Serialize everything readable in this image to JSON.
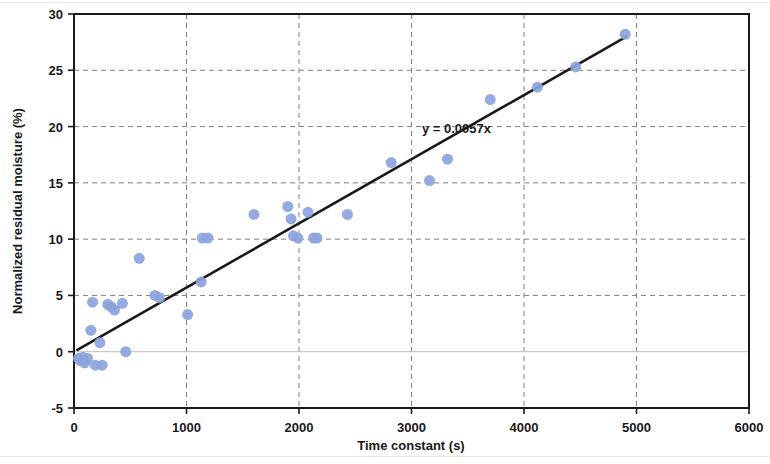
{
  "chart_data": {
    "type": "scatter",
    "title": "",
    "xlabel": "Time constant (s)",
    "ylabel": "Normalized residual moisture (%)",
    "xlim": [
      0,
      6000
    ],
    "ylim": [
      -5,
      30
    ],
    "xticks": [
      0,
      1000,
      2000,
      3000,
      4000,
      5000,
      6000
    ],
    "yticks": [
      -5,
      0,
      5,
      10,
      15,
      20,
      25,
      30
    ],
    "xtick_labels": [
      "0",
      "1000",
      "2000",
      "3000",
      "4000",
      "5000",
      "6000"
    ],
    "ytick_labels": [
      "-5",
      "0",
      "5",
      "10",
      "15",
      "20",
      "25",
      "30"
    ],
    "grid": true,
    "grid_style": "dashed",
    "grid_color": "#808080",
    "legend": false,
    "marker_color": "#8ba3dd",
    "marker_shape": "circle",
    "marker_size": 11,
    "series": [
      {
        "name": "Measurements",
        "points": [
          [
            40,
            -0.6
          ],
          [
            55,
            -0.8
          ],
          [
            80,
            -0.5
          ],
          [
            95,
            -1.0
          ],
          [
            120,
            -0.6
          ],
          [
            150,
            1.9
          ],
          [
            165,
            4.4
          ],
          [
            190,
            -1.2
          ],
          [
            230,
            0.8
          ],
          [
            250,
            -1.2
          ],
          [
            300,
            4.2
          ],
          [
            330,
            4.0
          ],
          [
            360,
            3.7
          ],
          [
            430,
            4.3
          ],
          [
            460,
            0.0
          ],
          [
            580,
            8.3
          ],
          [
            720,
            5.0
          ],
          [
            760,
            4.8
          ],
          [
            1010,
            3.3
          ],
          [
            1130,
            6.2
          ],
          [
            1140,
            10.1
          ],
          [
            1190,
            10.1
          ],
          [
            1600,
            12.2
          ],
          [
            1900,
            12.9
          ],
          [
            1930,
            11.8
          ],
          [
            1950,
            10.3
          ],
          [
            1990,
            10.1
          ],
          [
            2080,
            12.4
          ],
          [
            2130,
            10.1
          ],
          [
            2160,
            10.1
          ],
          [
            2430,
            12.2
          ],
          [
            2820,
            16.8
          ],
          [
            3160,
            15.2
          ],
          [
            3320,
            17.1
          ],
          [
            3700,
            22.4
          ],
          [
            4120,
            23.5
          ],
          [
            4460,
            25.3
          ],
          [
            4900,
            28.2
          ]
        ]
      }
    ],
    "trendline": {
      "equation_label": "y = 0.0057x",
      "slope": 0.0057,
      "intercept": 0,
      "x_start": 30,
      "x_end": 4910,
      "color": "#1a1a1a",
      "width": 2.6
    },
    "annotations": [
      {
        "text": "y = 0.0057x",
        "x": 3400,
        "y": 19.4
      }
    ]
  },
  "axes": {
    "x_title": "Time constant (s)",
    "y_title": "Normalized residual moisture (%)"
  }
}
